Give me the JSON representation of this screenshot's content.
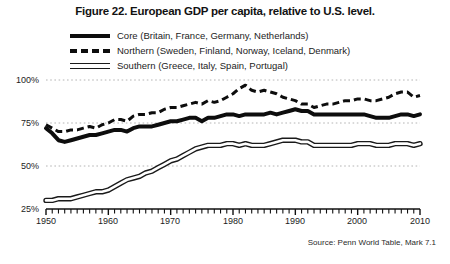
{
  "figure": {
    "title": "Figure 22. European GDP per capita, relative to U.S. level.",
    "source": "Source: Penn World Table, Mark 7.1"
  },
  "legend": {
    "items": [
      {
        "style": "solid-thick",
        "label": "Core (Britain, France, Germany, Netherlands)"
      },
      {
        "style": "dashed",
        "label": "Northern (Sweden, Finland, Norway, Iceland, Denmark)"
      },
      {
        "style": "double-line",
        "label": "Southern (Greece, Italy, Spain, Portugal)"
      }
    ]
  },
  "axes": {
    "y_ticks": [
      "100%",
      "75%",
      "50%",
      "25%"
    ],
    "x_ticks": [
      "1950",
      "1960",
      "1970",
      "1980",
      "1990",
      "2000",
      "2010"
    ]
  },
  "chart_data": {
    "type": "line",
    "title": "Figure 22. European GDP per capita, relative to U.S. level.",
    "subtitle": "",
    "xlabel": "",
    "ylabel": "GDP per capita relative to U.S. level (percent)",
    "xlim": [
      1950,
      2010
    ],
    "ylim": [
      25,
      100
    ],
    "ytick_values": [
      25,
      50,
      75,
      100
    ],
    "ytick_labels": [
      "25%",
      "50%",
      "75%",
      "100%"
    ],
    "xtick_values": [
      1950,
      1960,
      1970,
      1980,
      1990,
      2000,
      2010
    ],
    "xtick_labels": [
      "1950",
      "1960",
      "1970",
      "1980",
      "1990",
      "2000",
      "2010"
    ],
    "minor_xticks": "annual",
    "grid": "horizontal-dotted",
    "legend_position": "above-plot",
    "annotations": [
      "Source: Penn World Table, Mark 7.1"
    ],
    "x": [
      1950,
      1951,
      1952,
      1953,
      1954,
      1955,
      1956,
      1957,
      1958,
      1959,
      1960,
      1961,
      1962,
      1963,
      1964,
      1965,
      1966,
      1967,
      1968,
      1969,
      1970,
      1971,
      1972,
      1973,
      1974,
      1975,
      1976,
      1977,
      1978,
      1979,
      1980,
      1981,
      1982,
      1983,
      1984,
      1985,
      1986,
      1987,
      1988,
      1989,
      1990,
      1991,
      1992,
      1993,
      1994,
      1995,
      1996,
      1997,
      1998,
      1999,
      2000,
      2001,
      2002,
      2003,
      2004,
      2005,
      2006,
      2007,
      2008,
      2009,
      2010
    ],
    "series": [
      {
        "name": "Core (Britain, France, Germany, Netherlands)",
        "style": "solid-thick",
        "color": "#0d0d0d",
        "values": [
          72,
          69,
          65,
          64,
          65,
          66,
          67,
          68,
          68,
          69,
          70,
          71,
          71,
          70,
          72,
          73,
          73,
          73,
          74,
          75,
          76,
          76,
          77,
          78,
          78,
          76,
          78,
          78,
          79,
          80,
          80,
          79,
          80,
          80,
          80,
          80,
          81,
          80,
          81,
          82,
          83,
          82,
          82,
          80,
          80,
          80,
          80,
          80,
          80,
          80,
          80,
          80,
          79,
          78,
          78,
          78,
          79,
          80,
          80,
          79,
          80
        ]
      },
      {
        "name": "Northern (Sweden, Finland, Norway, Iceland, Denmark)",
        "style": "dashed",
        "color": "#0d0d0d",
        "values": [
          74,
          72,
          70,
          70,
          71,
          71,
          72,
          73,
          72,
          74,
          75,
          77,
          77,
          76,
          79,
          80,
          80,
          81,
          81,
          83,
          84,
          84,
          85,
          86,
          87,
          86,
          88,
          87,
          88,
          90,
          92,
          95,
          97,
          94,
          93,
          94,
          93,
          92,
          90,
          89,
          88,
          86,
          86,
          84,
          85,
          86,
          86,
          87,
          88,
          88,
          89,
          89,
          88,
          88,
          89,
          90,
          92,
          93,
          93,
          90,
          91
        ]
      },
      {
        "name": "Southern (Greece, Italy, Spain, Portugal)",
        "style": "double-line",
        "color": "#1a1a1a",
        "values": [
          30,
          30,
          31,
          31,
          31,
          32,
          33,
          34,
          35,
          35,
          36,
          38,
          40,
          42,
          43,
          44,
          46,
          47,
          49,
          51,
          53,
          54,
          56,
          58,
          60,
          61,
          62,
          62,
          62,
          63,
          63,
          62,
          63,
          62,
          62,
          62,
          63,
          64,
          65,
          65,
          65,
          64,
          64,
          62,
          62,
          62,
          62,
          62,
          62,
          62,
          63,
          63,
          63,
          62,
          62,
          62,
          63,
          63,
          63,
          62,
          63
        ]
      }
    ]
  }
}
